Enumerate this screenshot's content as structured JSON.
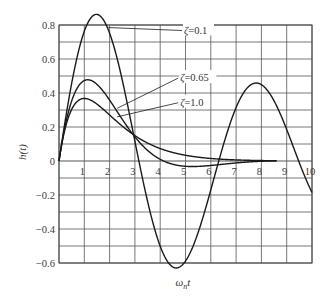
{
  "chart_data": {
    "type": "line",
    "title": "",
    "xlabel": "ωnt",
    "ylabel": "h(t)",
    "xlim": [
      0,
      10
    ],
    "ylim": [
      -0.6,
      0.8
    ],
    "grid": true,
    "x_ticks": [
      "1",
      "2",
      "3",
      "4",
      "5",
      "6",
      "7",
      "8",
      "9",
      "10"
    ],
    "y_ticks": [
      "0.8",
      "0.6",
      "0.4",
      "0.2",
      "0",
      "−0.2",
      "−0.4",
      "−0.6"
    ],
    "y_tick_values": [
      0.8,
      0.6,
      0.4,
      0.2,
      0,
      -0.2,
      -0.4,
      -0.6
    ],
    "x_grid_step": 1,
    "y_grid_step": 0.1,
    "series": [
      {
        "name": "ζ=0.1",
        "zeta": 0.1,
        "x_end": 10,
        "x": [
          0,
          0.5,
          1,
          1.5,
          2,
          2.5,
          3,
          3.5,
          4,
          4.5,
          5,
          5.5,
          6,
          6.5,
          7,
          7.5,
          8,
          8.5,
          9,
          9.5,
          10
        ],
        "values": [
          0,
          0.45,
          0.76,
          0.86,
          0.74,
          0.45,
          0.1,
          -0.26,
          -0.52,
          -0.63,
          -0.57,
          -0.37,
          -0.09,
          0.18,
          0.38,
          0.44,
          0.37,
          0.2,
          -0.01,
          -0.18,
          -0.21
        ]
      },
      {
        "name": "ζ=0.65",
        "zeta": 0.65,
        "x_end": 8.6,
        "x": [
          0,
          0.5,
          1,
          1.5,
          2,
          2.5,
          3,
          3.5,
          4,
          5,
          6,
          7,
          8
        ],
        "values": [
          0,
          0.36,
          0.46,
          0.41,
          0.3,
          0.2,
          0.11,
          0.05,
          0.01,
          -0.02,
          -0.02,
          -0.01,
          0.0
        ]
      },
      {
        "name": "ζ=1.0",
        "zeta": 1.0,
        "x_end": 8.6,
        "x": [
          0,
          0.5,
          1,
          1.5,
          2,
          2.5,
          3,
          4,
          5,
          6,
          7,
          8
        ],
        "values": [
          0,
          0.3,
          0.37,
          0.33,
          0.27,
          0.21,
          0.15,
          0.07,
          0.03,
          0.015,
          0.006,
          0.003
        ]
      }
    ],
    "annotations": [
      {
        "text": "ζ=0.1",
        "x": 4.9,
        "y": 0.75,
        "arrow_to": [
          1.95,
          0.785
        ]
      },
      {
        "text": "ζ=0.65",
        "x": 4.75,
        "y": 0.47,
        "arrow_to": [
          2.3,
          0.31
        ]
      },
      {
        "text": "ζ=1.0",
        "x": 4.75,
        "y": 0.325,
        "arrow_to": [
          2.3,
          0.26
        ]
      }
    ],
    "colors": {
      "curve": "#1a1a1a",
      "grid": "#555555",
      "background": "#ffffff"
    }
  }
}
